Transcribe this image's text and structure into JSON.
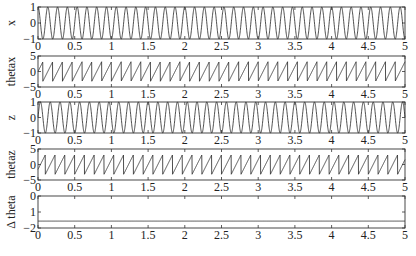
{
  "chart_data": {
    "type": "line",
    "layout": "5 vertically stacked subplots sharing x-axis",
    "x_range": [
      0,
      5
    ],
    "x_ticks": [
      "0",
      "0.5",
      "1",
      "1.5",
      "2",
      "2.5",
      "3",
      "3.5",
      "4",
      "4.5",
      "5"
    ],
    "grid": false,
    "legend": null,
    "panels": [
      {
        "id": "x",
        "ylabel": "x",
        "ylim": [
          -1,
          1
        ],
        "y_ticks": [
          "1",
          "0",
          "-1"
        ],
        "y_tick_values": [
          1,
          0,
          -1
        ],
        "signal": "cosine-like oscillation, amplitude 1, ~7.5 cycles per unit time",
        "waveform": "cos",
        "amplitude": 1,
        "frequency": 7.5,
        "phase": 0
      },
      {
        "id": "thetax",
        "ylabel": "thetax",
        "ylim": [
          -5,
          5
        ],
        "y_ticks": [
          "5",
          "0",
          "-5"
        ],
        "y_tick_values": [
          5,
          0,
          -5
        ],
        "signal": "phase of x wrapped to [-pi, pi], sawtooth ~7.5 teeth per unit time",
        "waveform": "sawtooth",
        "amplitude": 3.14,
        "frequency": 7.5,
        "phase": 0
      },
      {
        "id": "z",
        "ylabel": "z",
        "ylim": [
          -1,
          1
        ],
        "y_ticks": [
          "1",
          "0",
          "-1"
        ],
        "y_tick_values": [
          1,
          0,
          -1
        ],
        "signal": "oscillation, amplitude 1, same frequency as x, phase-shifted",
        "waveform": "cos",
        "amplitude": 1,
        "frequency": 7.5,
        "phase": -1.57
      },
      {
        "id": "thetaz",
        "ylabel": "thetaz",
        "ylim": [
          -5,
          5
        ],
        "y_ticks": [
          "5",
          "0",
          "-5"
        ],
        "y_tick_values": [
          5,
          0,
          -5
        ],
        "signal": "phase of z wrapped to [-pi, pi], sawtooth",
        "waveform": "sawtooth",
        "amplitude": 3.14,
        "frequency": 7.5,
        "phase": -1.57
      },
      {
        "id": "delta_theta",
        "ylabel": "Δ theta",
        "ylim": [
          -2,
          0
        ],
        "y_ticks": [
          "0",
          "1",
          "-2"
        ],
        "y_tick_values": [
          0,
          -1,
          -2
        ],
        "signal": "constant phase difference",
        "waveform": "constant",
        "value": -1.57
      }
    ]
  }
}
